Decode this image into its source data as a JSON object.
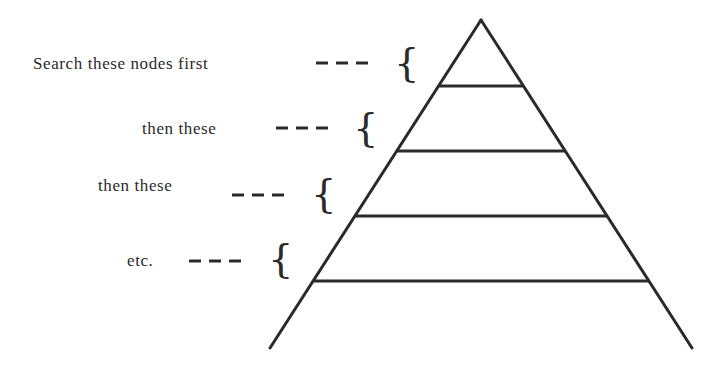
{
  "diagram": {
    "title": "",
    "labels": [
      {
        "text": "Search these nodes first",
        "dash": "- - -"
      },
      {
        "text": "then these",
        "dash": "- - -"
      },
      {
        "text": "then these",
        "dash": "- - -"
      },
      {
        "text": "etc.",
        "dash": "- - -"
      }
    ],
    "shape": "pyramid (search tree levels)",
    "levels": 5,
    "colors": {
      "ink": "#2a2a2a",
      "background": "#ffffff"
    }
  }
}
